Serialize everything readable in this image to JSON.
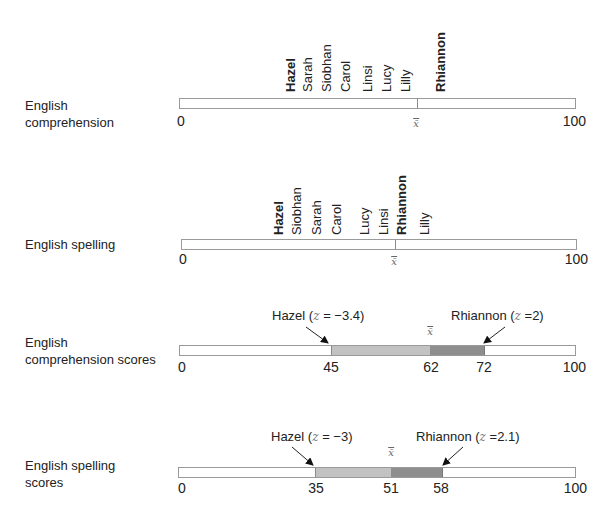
{
  "rows": [
    {
      "label_line1": "English",
      "label_line2": "comprehension",
      "axis_min": "0",
      "axis_max": "100",
      "mean_symbol": "x̄",
      "names": [
        "Hazel",
        "Sarah",
        "Siobhan",
        "Carol",
        "Linsi",
        "Lucy",
        "Lilly",
        "Rhiannon"
      ]
    },
    {
      "label_line1": "English spelling",
      "axis_min": "0",
      "axis_max": "100",
      "mean_symbol": "x̄",
      "names": [
        "Hazel",
        "Siobhan",
        "Sarah",
        "Carol",
        "Lucy",
        "Linsi",
        "Rhiannon",
        "Lilly"
      ]
    },
    {
      "label_line1": "English",
      "label_line2": "comprehension scores",
      "axis_min": "0",
      "axis_max": "100",
      "mean_symbol": "x̄",
      "ticks": [
        "45",
        "62",
        "72"
      ],
      "callout_left_name": "Hazel (",
      "callout_left_z": "z",
      "callout_left_val": " = −3.4)",
      "callout_right_name": "Rhiannon (",
      "callout_right_z": "z",
      "callout_right_val": " =2)"
    },
    {
      "label_line1": "English spelling",
      "label_line2": "scores",
      "axis_min": "0",
      "axis_max": "100",
      "mean_symbol": "x̄",
      "ticks": [
        "35",
        "51",
        "58"
      ],
      "callout_left_name": "Hazel (",
      "callout_left_z": "z",
      "callout_left_val": " = −3)",
      "callout_right_name": "Rhiannon (",
      "callout_right_z": "z",
      "callout_right_val": " =2.1)"
    }
  ],
  "colors": {
    "bar_border": "#9a9a9a",
    "below_mean_fill": "#c2c2c2",
    "above_mean_fill": "#8e8e8e"
  }
}
